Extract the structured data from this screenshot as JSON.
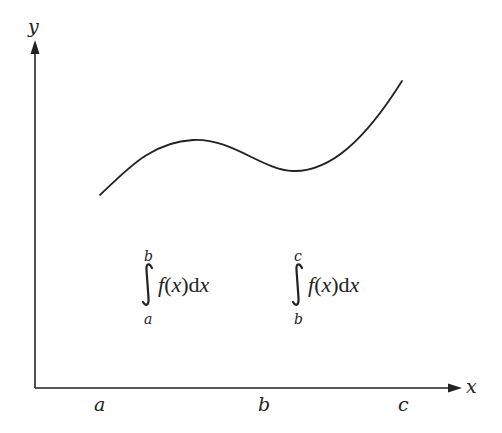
{
  "diagram": {
    "title": "",
    "axes": {
      "x_label": "x",
      "y_label": "y",
      "x_ticks": [
        {
          "label": "a",
          "x": 100
        },
        {
          "label": "b",
          "x": 264
        },
        {
          "label": "c",
          "x": 403
        }
      ]
    },
    "curve": {
      "name": "f(x)",
      "points": [
        [
          100,
          195
        ],
        [
          193,
          140
        ],
        [
          293,
          171
        ],
        [
          402,
          81
        ]
      ]
    },
    "integrals": [
      {
        "lower": "a",
        "upper": "b",
        "integrand": "f(x)dx",
        "f": "f",
        "lparen": "(",
        "var": "x",
        "rparen": ")",
        "d": "d",
        "dvar": "x"
      },
      {
        "lower": "b",
        "upper": "c",
        "integrand": "f(x)dx",
        "f": "f",
        "lparen": "(",
        "var": "x",
        "rparen": ")",
        "d": "d",
        "dvar": "x"
      }
    ],
    "colors": {
      "line": "#222222",
      "background": "#ffffff"
    }
  }
}
